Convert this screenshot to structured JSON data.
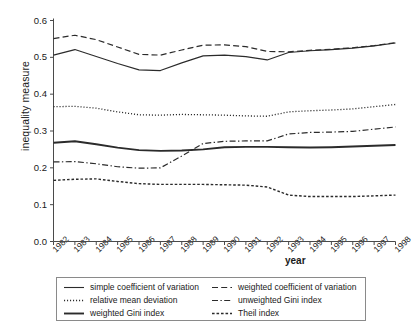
{
  "chart_data": {
    "type": "line",
    "title": "",
    "xlabel": "year",
    "ylabel": "inequality measure",
    "grid": false,
    "legend_position": "bottom",
    "xlim": [
      1982,
      1998
    ],
    "ylim": [
      0.0,
      0.6
    ],
    "ytick_labels": [
      "0.6",
      "0.5",
      "0.4",
      "0.3",
      "0.2",
      "0.1",
      "0.0"
    ],
    "ytick_values": [
      0.6,
      0.5,
      0.4,
      0.3,
      0.2,
      0.1,
      0.0
    ],
    "categories": [
      "1982",
      "1983",
      "1984",
      "1985",
      "1986",
      "1987",
      "1988",
      "1989",
      "1990",
      "1991",
      "1992",
      "1993",
      "1994",
      "1995",
      "1996",
      "1997",
      "1998"
    ],
    "x": [
      1982,
      1983,
      1984,
      1985,
      1986,
      1987,
      1988,
      1989,
      1990,
      1991,
      1992,
      1993,
      1994,
      1995,
      1996,
      1997,
      1998
    ],
    "series": [
      {
        "name": "simple coefficient of variation",
        "style": "solid",
        "values": [
          0.506,
          0.521,
          0.502,
          0.483,
          0.466,
          0.464,
          0.485,
          0.504,
          0.506,
          0.502,
          0.493,
          0.513,
          0.518,
          0.521,
          0.525,
          0.531,
          0.539
        ]
      },
      {
        "name": "weighted coefficient of variation",
        "style": "dashed",
        "values": [
          0.551,
          0.56,
          0.548,
          0.528,
          0.508,
          0.506,
          0.52,
          0.533,
          0.534,
          0.529,
          0.516,
          0.515,
          0.519,
          0.522,
          0.526,
          0.532,
          0.54
        ]
      },
      {
        "name": "relative mean deviation",
        "style": "dotted",
        "values": [
          0.366,
          0.367,
          0.362,
          0.352,
          0.344,
          0.343,
          0.345,
          0.344,
          0.343,
          0.341,
          0.34,
          0.352,
          0.355,
          0.357,
          0.36,
          0.366,
          0.372
        ]
      },
      {
        "name": "unweighted Gini index",
        "style": "dashdot",
        "values": [
          0.216,
          0.217,
          0.211,
          0.203,
          0.199,
          0.2,
          0.232,
          0.266,
          0.272,
          0.273,
          0.273,
          0.292,
          0.296,
          0.297,
          0.299,
          0.305,
          0.311
        ]
      },
      {
        "name": "weighted Gini index",
        "style": "solid-thick",
        "values": [
          0.268,
          0.272,
          0.264,
          0.255,
          0.248,
          0.246,
          0.247,
          0.25,
          0.256,
          0.257,
          0.257,
          0.256,
          0.255,
          0.256,
          0.258,
          0.26,
          0.262
        ]
      },
      {
        "name": "Theil index",
        "style": "smalldash",
        "values": [
          0.166,
          0.169,
          0.17,
          0.163,
          0.157,
          0.155,
          0.155,
          0.155,
          0.154,
          0.153,
          0.148,
          0.126,
          0.122,
          0.122,
          0.122,
          0.124,
          0.126
        ]
      }
    ]
  },
  "legend": {
    "entries": [
      {
        "label": "simple coefficient of variation",
        "style": "solid"
      },
      {
        "label": "weighted coefficient of variation",
        "style": "dashed"
      },
      {
        "label": "relative mean deviation",
        "style": "dotted"
      },
      {
        "label": "unweighted Gini index",
        "style": "dashdot"
      },
      {
        "label": "weighted Gini index",
        "style": "solid-thick"
      },
      {
        "label": "Theil index",
        "style": "smalldash"
      }
    ]
  },
  "colors": {
    "line": "#2b2b2b",
    "axis": "#4a4a4a",
    "background": "#ffffff",
    "legend_border": "#8a8a8a"
  }
}
